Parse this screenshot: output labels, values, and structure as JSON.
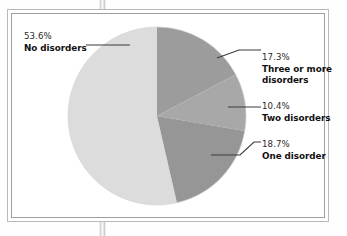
{
  "figure": {
    "frame_style": "double-rule-box",
    "background_color": "#ffffff"
  },
  "chart_data": {
    "type": "pie",
    "title": "",
    "subtitle": "",
    "xlabel": "",
    "ylabel": "",
    "legend_position": "none",
    "labels_position": "outside-with-leader-lines",
    "start_angle_deg": 0,
    "direction": "clockwise",
    "categories": [
      "Three or more disorders",
      "Two disorders",
      "One disorder",
      "No disorders"
    ],
    "values": [
      17.3,
      10.4,
      18.7,
      53.6
    ],
    "value_labels": [
      "17.3%",
      "10.4%",
      "18.7%",
      "53.6%"
    ],
    "units": "percent",
    "total": 100.0,
    "colors": [
      "#9c9c9c",
      "#a8a8a8",
      "#969696",
      "#dcdcdc"
    ],
    "slices": [
      {
        "name": "Three or more disorders",
        "value": 17.3,
        "value_label": "17.3%",
        "label_lines": [
          "Three or more",
          "disorders"
        ],
        "color": "#9c9c9c",
        "start_deg": 0.0,
        "end_deg": 62.28
      },
      {
        "name": "Two disorders",
        "value": 10.4,
        "value_label": "10.4%",
        "label_lines": [
          "Two disorders"
        ],
        "color": "#a8a8a8",
        "start_deg": 62.28,
        "end_deg": 99.72
      },
      {
        "name": "One disorder",
        "value": 18.7,
        "value_label": "18.7%",
        "label_lines": [
          "One disorder"
        ],
        "color": "#969696",
        "start_deg": 99.72,
        "end_deg": 167.04
      },
      {
        "name": "No disorders",
        "value": 53.6,
        "value_label": "53.6%",
        "label_lines": [
          "No disorders"
        ],
        "color": "#dcdcdc",
        "start_deg": 167.04,
        "end_deg": 360.0
      }
    ]
  },
  "labels": {
    "no_disorders": {
      "percent": "53.6%",
      "caption": "No disorders"
    },
    "three_or_more": {
      "percent": "17.3%",
      "caption_line1": "Three or more",
      "caption_line2": "disorders"
    },
    "two": {
      "percent": "10.4%",
      "caption": "Two disorders"
    },
    "one": {
      "percent": "18.7%",
      "caption": "One disorder"
    }
  }
}
